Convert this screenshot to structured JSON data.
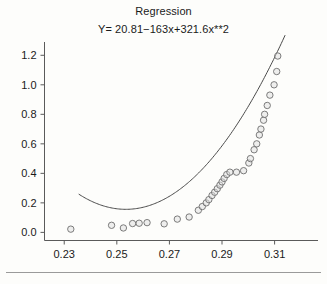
{
  "chart_data": {
    "type": "scatter",
    "title": "Regression",
    "subtitle": "Y= 20.81−163x+321.6x**2",
    "xlabel": "",
    "ylabel": "",
    "xlim": [
      0.2225,
      0.3265
    ],
    "ylim": [
      -0.055,
      1.29
    ],
    "grid": false,
    "legend": null,
    "xticks": [
      0.23,
      0.25,
      0.27,
      0.29,
      0.31
    ],
    "xtick_labels": [
      "0.23",
      "0.25",
      "0.27",
      "0.29",
      "0.31"
    ],
    "yticks": [
      0.0,
      0.2,
      0.4,
      0.6,
      0.8,
      1.0,
      1.2
    ],
    "ytick_labels": [
      "0.0",
      "0.2",
      "0.4",
      "0.6",
      "0.8",
      "1.0",
      "1.2"
    ],
    "marker_style": "open-circle",
    "points": [
      {
        "x": 0.2325,
        "y": 0.022
      },
      {
        "x": 0.248,
        "y": 0.048
      },
      {
        "x": 0.2525,
        "y": 0.03
      },
      {
        "x": 0.256,
        "y": 0.06
      },
      {
        "x": 0.2585,
        "y": 0.062
      },
      {
        "x": 0.2615,
        "y": 0.066
      },
      {
        "x": 0.268,
        "y": 0.058
      },
      {
        "x": 0.273,
        "y": 0.09
      },
      {
        "x": 0.2775,
        "y": 0.104
      },
      {
        "x": 0.281,
        "y": 0.15
      },
      {
        "x": 0.2825,
        "y": 0.175
      },
      {
        "x": 0.284,
        "y": 0.2
      },
      {
        "x": 0.285,
        "y": 0.222
      },
      {
        "x": 0.2862,
        "y": 0.25
      },
      {
        "x": 0.2872,
        "y": 0.272
      },
      {
        "x": 0.2882,
        "y": 0.296
      },
      {
        "x": 0.2892,
        "y": 0.32
      },
      {
        "x": 0.29,
        "y": 0.342
      },
      {
        "x": 0.2908,
        "y": 0.366
      },
      {
        "x": 0.2918,
        "y": 0.392
      },
      {
        "x": 0.293,
        "y": 0.408
      },
      {
        "x": 0.2955,
        "y": 0.408
      },
      {
        "x": 0.2982,
        "y": 0.418
      },
      {
        "x": 0.3002,
        "y": 0.47
      },
      {
        "x": 0.3008,
        "y": 0.5
      },
      {
        "x": 0.3022,
        "y": 0.56
      },
      {
        "x": 0.3032,
        "y": 0.6
      },
      {
        "x": 0.3042,
        "y": 0.66
      },
      {
        "x": 0.3048,
        "y": 0.7
      },
      {
        "x": 0.3058,
        "y": 0.76
      },
      {
        "x": 0.3062,
        "y": 0.8
      },
      {
        "x": 0.3072,
        "y": 0.86
      },
      {
        "x": 0.3082,
        "y": 0.93
      },
      {
        "x": 0.3098,
        "y": 1.0
      },
      {
        "x": 0.3108,
        "y": 1.09
      },
      {
        "x": 0.3112,
        "y": 1.195
      }
    ],
    "fit": {
      "equation": "Y= 20.81−163x+321.6x**2",
      "intercept": 20.81,
      "linear_coefficient": -163,
      "quadratic_coefficient": 321.6,
      "x_start": 0.2355,
      "x_end": 0.314
    }
  }
}
